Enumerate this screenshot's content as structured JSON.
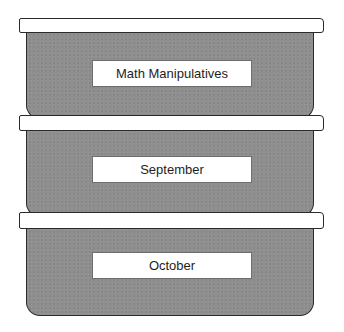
{
  "diagram": {
    "type": "stacked-storage-bins",
    "colors": {
      "bin_fill": "#8f8f8f",
      "lid_fill": "#ffffff",
      "outline": "#2a2a2a",
      "label_fill": "#ffffff",
      "label_text": "#1e1e1e"
    },
    "bins": [
      {
        "label": "Math Manipulatives"
      },
      {
        "label": "September"
      },
      {
        "label": "October"
      }
    ]
  }
}
